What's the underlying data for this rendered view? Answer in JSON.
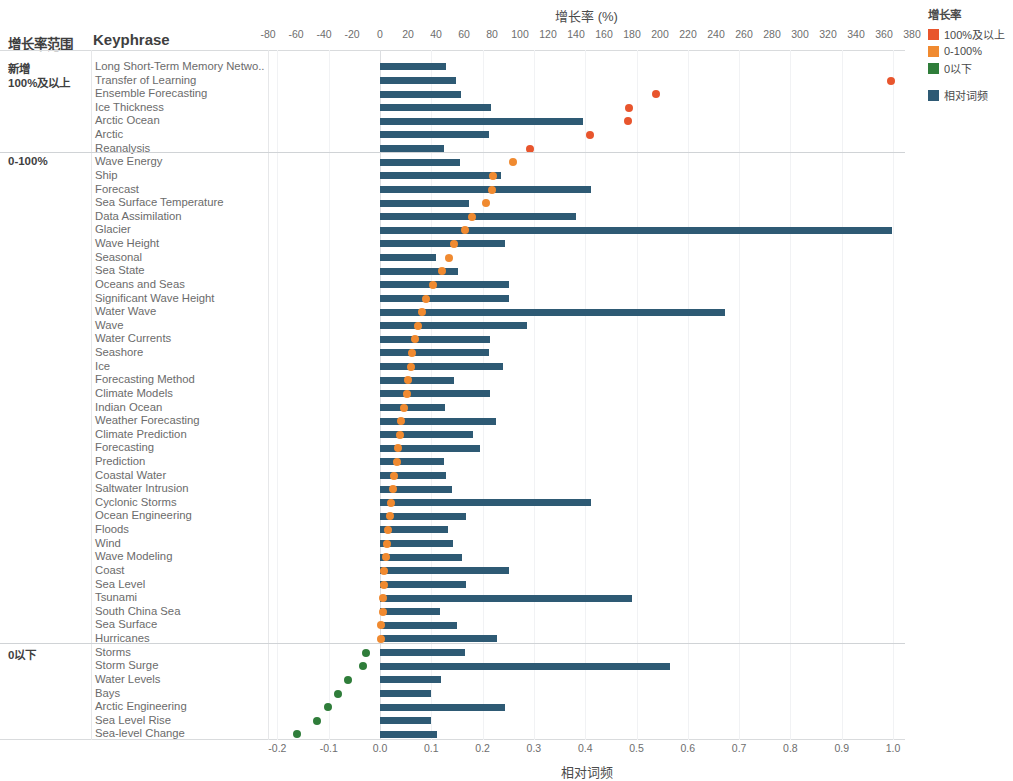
{
  "chart_data": {
    "type": "bar",
    "title": "增长率 (%)",
    "xlabel": "相对词频",
    "ylabel": "Keyphrase",
    "top_axis": {
      "label": "增长率 (%)",
      "ticks": [
        -80,
        -60,
        -40,
        -20,
        0,
        20,
        40,
        60,
        80,
        100,
        120,
        140,
        160,
        180,
        200,
        220,
        240,
        260,
        280,
        300,
        320,
        340,
        360,
        380
      ],
      "range": [
        -90,
        390
      ]
    },
    "bottom_axis": {
      "label": "相对词频",
      "ticks": [
        "-0.2",
        "-0.1",
        "0.0",
        "0.1",
        "0.2",
        "0.3",
        "0.4",
        "0.5",
        "0.6",
        "0.7",
        "0.8",
        "0.9",
        "1.0"
      ],
      "range": [
        -0.22,
        1.03
      ]
    },
    "columns": {
      "group": "增长率范围",
      "keyphrase": "Keyphrase"
    },
    "grid": true,
    "legend_position": "right",
    "series": [
      {
        "name": "相对词频",
        "type": "bar",
        "color": "#2e5a74",
        "axis": "bottom"
      },
      {
        "name": "增长率",
        "type": "scatter",
        "axis": "top"
      }
    ],
    "groups": [
      {
        "label": "新增\n100%及以上",
        "label_lines": [
          "新增",
          "100%及以上"
        ],
        "color": "#e8552d",
        "rows": [
          {
            "keyphrase": "Long Short-Term Memory Netwo..",
            "freq": 0.128,
            "growth": null
          },
          {
            "keyphrase": "Transfer of Learning",
            "freq": 0.148,
            "growth": 365
          },
          {
            "keyphrase": "Ensemble Forecasting",
            "freq": 0.158,
            "growth": 197
          },
          {
            "keyphrase": "Ice Thickness",
            "freq": 0.216,
            "growth": 178
          },
          {
            "keyphrase": "Arctic Ocean",
            "freq": 0.396,
            "growth": 177
          },
          {
            "keyphrase": "Arctic",
            "freq": 0.213,
            "growth": 150
          },
          {
            "keyphrase": "Reanalysis",
            "freq": 0.124,
            "growth": 107
          }
        ]
      },
      {
        "label": "0-100%",
        "label_lines": [
          "0-100%"
        ],
        "color": "#f08a30",
        "rows": [
          {
            "keyphrase": "Wave Energy",
            "freq": 0.155,
            "growth": 95
          },
          {
            "keyphrase": "Ship",
            "freq": 0.236,
            "growth": 81
          },
          {
            "keyphrase": "Forecast",
            "freq": 0.412,
            "growth": 80
          },
          {
            "keyphrase": "Sea Surface Temperature",
            "freq": 0.173,
            "growth": 76
          },
          {
            "keyphrase": "Data Assimilation",
            "freq": 0.382,
            "growth": 66
          },
          {
            "keyphrase": "Glacier",
            "freq": 0.999,
            "growth": 61
          },
          {
            "keyphrase": "Wave Height",
            "freq": 0.243,
            "growth": 53
          },
          {
            "keyphrase": "Seasonal",
            "freq": 0.11,
            "growth": 49
          },
          {
            "keyphrase": "Sea State",
            "freq": 0.152,
            "growth": 44
          },
          {
            "keyphrase": "Oceans and Seas",
            "freq": 0.252,
            "growth": 38
          },
          {
            "keyphrase": "Significant Wave Height",
            "freq": 0.252,
            "growth": 33
          },
          {
            "keyphrase": "Water Wave",
            "freq": 0.672,
            "growth": 30
          },
          {
            "keyphrase": "Wave",
            "freq": 0.286,
            "growth": 27
          },
          {
            "keyphrase": "Water Currents",
            "freq": 0.214,
            "growth": 25
          },
          {
            "keyphrase": "Seashore",
            "freq": 0.212,
            "growth": 23
          },
          {
            "keyphrase": "Ice",
            "freq": 0.24,
            "growth": 22
          },
          {
            "keyphrase": "Forecasting Method",
            "freq": 0.145,
            "growth": 20
          },
          {
            "keyphrase": "Climate Models",
            "freq": 0.214,
            "growth": 19
          },
          {
            "keyphrase": "Indian Ocean",
            "freq": 0.126,
            "growth": 17
          },
          {
            "keyphrase": "Weather Forecasting",
            "freq": 0.227,
            "growth": 15
          },
          {
            "keyphrase": "Climate Prediction",
            "freq": 0.182,
            "growth": 14
          },
          {
            "keyphrase": "Forecasting",
            "freq": 0.195,
            "growth": 13
          },
          {
            "keyphrase": "Prediction",
            "freq": 0.125,
            "growth": 12
          },
          {
            "keyphrase": "Coastal Water",
            "freq": 0.128,
            "growth": 10
          },
          {
            "keyphrase": "Saltwater Intrusion",
            "freq": 0.14,
            "growth": 9
          },
          {
            "keyphrase": "Cyclonic Storms",
            "freq": 0.412,
            "growth": 8
          },
          {
            "keyphrase": "Ocean Engineering",
            "freq": 0.168,
            "growth": 7
          },
          {
            "keyphrase": "Floods",
            "freq": 0.133,
            "growth": 6
          },
          {
            "keyphrase": "Wind",
            "freq": 0.143,
            "growth": 5
          },
          {
            "keyphrase": "Wave Modeling",
            "freq": 0.16,
            "growth": 4
          },
          {
            "keyphrase": "Coast",
            "freq": 0.252,
            "growth": 3
          },
          {
            "keyphrase": "Sea Level",
            "freq": 0.167,
            "growth": 3
          },
          {
            "keyphrase": "Tsunami",
            "freq": 0.492,
            "growth": 2
          },
          {
            "keyphrase": "South China Sea",
            "freq": 0.117,
            "growth": 2
          },
          {
            "keyphrase": "Sea Surface",
            "freq": 0.15,
            "growth": 1
          },
          {
            "keyphrase": "Hurricanes",
            "freq": 0.228,
            "growth": 1
          }
        ]
      },
      {
        "label": "0以下",
        "label_lines": [
          "0以下"
        ],
        "color": "#2f7d3a",
        "rows": [
          {
            "keyphrase": "Arctic Engineering",
            "freq": 0.168,
            "growth": -1
          },
          {
            "keyphrase": "Storms",
            "freq": 0.166,
            "growth": -15
          },
          {
            "keyphrase": "Storm Surge",
            "freq": 0.566,
            "growth": -19
          },
          {
            "keyphrase": "Water Levels",
            "freq": 0.118,
            "growth": -27
          },
          {
            "keyphrase": "Bays",
            "freq": 0.1,
            "growth": -33
          },
          {
            "keyphrase": "Arctic Engineering2",
            "freq": 0.243,
            "growth": -39
          },
          {
            "keyphrase": "Sea Level Rise",
            "freq": 0.1,
            "growth": -47
          },
          {
            "keyphrase": "Sea-level Change",
            "freq": 0.112,
            "growth": -57
          }
        ],
        "rows_real": [
          {
            "keyphrase": "Storms",
            "freq": 0.166,
            "growth": -10
          },
          {
            "keyphrase": "Storm Surge",
            "freq": 0.566,
            "growth": -12
          },
          {
            "keyphrase": "Water Levels",
            "freq": 0.118,
            "growth": -23
          },
          {
            "keyphrase": "Bays",
            "freq": 0.1,
            "growth": -30
          },
          {
            "keyphrase": "Arctic Engineering",
            "freq": 0.243,
            "growth": -37
          },
          {
            "keyphrase": "Sea Level Rise",
            "freq": 0.1,
            "growth": -45
          },
          {
            "keyphrase": "Sea-level Change",
            "freq": 0.112,
            "growth": -59
          }
        ]
      }
    ]
  },
  "legend": {
    "title": "增长率",
    "items": [
      {
        "label": "100%及以上",
        "color": "#e8552d"
      },
      {
        "label": "0-100%",
        "color": "#f08a30"
      },
      {
        "label": "0以下",
        "color": "#2f7d3a"
      }
    ],
    "items2": [
      {
        "label": "相对词频",
        "color": "#2e5a74"
      }
    ]
  }
}
